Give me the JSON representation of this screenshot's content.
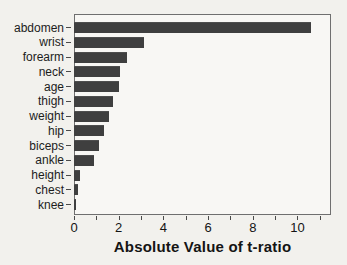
{
  "figure": {
    "paper_color": "#f2f1ed",
    "plot_bg_color": "#f8f7f4",
    "bar_color": "#3f3f3f",
    "frame_color": "#6f6f6f",
    "tick_color": "#4a4a4a"
  },
  "chart_data": {
    "type": "bar",
    "orientation": "horizontal",
    "title": "",
    "xlabel": "Absolute Value of t-ratio",
    "ylabel": "",
    "categories": [
      "abdomen",
      "wrist",
      "forearm",
      "neck",
      "age",
      "thigh",
      "weight",
      "hip",
      "biceps",
      "ankle",
      "height",
      "chest",
      "knee"
    ],
    "values": [
      10.6,
      3.15,
      2.35,
      2.05,
      2.0,
      1.75,
      1.55,
      1.35,
      1.1,
      0.9,
      0.27,
      0.2,
      0.08
    ],
    "xlim": [
      0,
      11.5
    ],
    "x_major_ticks": [
      0,
      2,
      4,
      6,
      8,
      10
    ],
    "x_minor_tick_step": 1,
    "x_minor_tick_max": 11,
    "grid": false,
    "legend": false
  }
}
